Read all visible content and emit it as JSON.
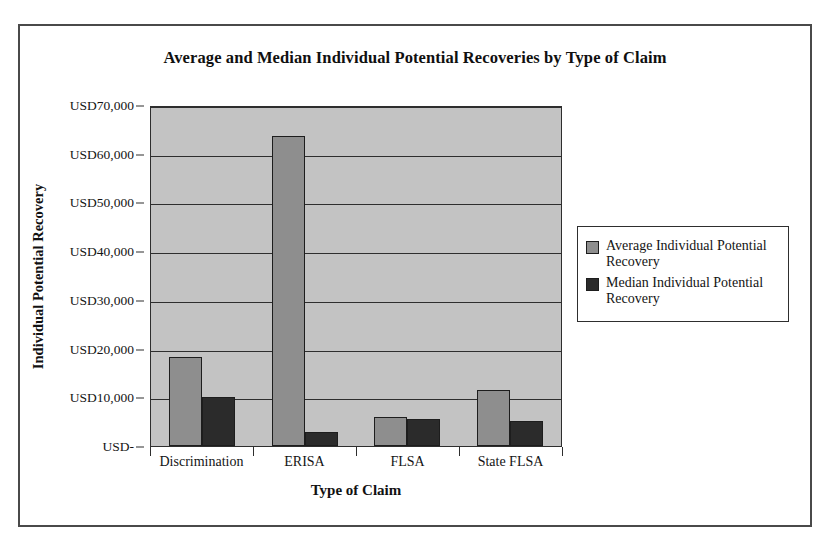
{
  "chart_data": {
    "type": "bar",
    "title": "Average and Median Individual Potential Recoveries by Type of Claim",
    "xlabel": "Type of Claim",
    "ylabel": "Individual Potential Recovery",
    "categories": [
      "Discrimination",
      "ERISA",
      "FLSA",
      "State FLSA"
    ],
    "series": [
      {
        "name": "Average Individual Potential Recovery",
        "color": "#8e8e8e",
        "values": [
          18300,
          63700,
          6000,
          11400
        ]
      },
      {
        "name": "Median Individual Potential Recovery",
        "color": "#2b2b2b",
        "values": [
          10000,
          2800,
          5500,
          5200
        ]
      }
    ],
    "ylim": [
      0,
      70000
    ],
    "yticks": [
      0,
      10000,
      20000,
      30000,
      40000,
      50000,
      60000,
      70000
    ],
    "ytick_labels": [
      "USD-",
      "USD10,000",
      "USD20,000",
      "USD30,000",
      "USD40,000",
      "USD50,000",
      "USD60,000",
      "USD70,000"
    ],
    "grid": true,
    "legend_position": "right",
    "legend": [
      "Average Individual Potential Recovery",
      "Median Individual Potential Recovery"
    ]
  }
}
